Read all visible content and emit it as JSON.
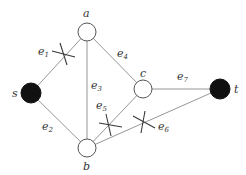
{
  "graph": {
    "nodes": [
      {
        "id": "s",
        "label": "s",
        "x": 31,
        "y": 93,
        "filled": true
      },
      {
        "id": "a",
        "label": "a",
        "x": 87,
        "y": 32,
        "filled": false
      },
      {
        "id": "b",
        "label": "b",
        "x": 87,
        "y": 148,
        "filled": false
      },
      {
        "id": "c",
        "label": "c",
        "x": 143,
        "y": 89,
        "filled": false
      },
      {
        "id": "t",
        "label": "t",
        "x": 220,
        "y": 89,
        "filled": true
      }
    ],
    "edges": [
      {
        "id": "e1",
        "base": "e",
        "sub": "1",
        "from": "s",
        "to": "a",
        "cut": true
      },
      {
        "id": "e2",
        "base": "e",
        "sub": "2",
        "from": "s",
        "to": "b",
        "cut": false
      },
      {
        "id": "e3",
        "base": "e",
        "sub": "3",
        "from": "a",
        "to": "b",
        "cut": false
      },
      {
        "id": "e4",
        "base": "e",
        "sub": "4",
        "from": "a",
        "to": "c",
        "cut": false
      },
      {
        "id": "e5",
        "base": "e",
        "sub": "5",
        "from": "b",
        "to": "c",
        "cut": true
      },
      {
        "id": "e6",
        "base": "e",
        "sub": "6",
        "from": "b",
        "to": "t",
        "cut": true
      },
      {
        "id": "e7",
        "base": "e",
        "sub": "7",
        "from": "c",
        "to": "t",
        "cut": false
      }
    ],
    "labels": {
      "s": "s",
      "a": "a",
      "b": "b",
      "c": "c",
      "t": "t",
      "e": "e",
      "e1_sub": "1",
      "e2_sub": "2",
      "e3_sub": "3",
      "e4_sub": "4",
      "e5_sub": "5",
      "e6_sub": "6",
      "e7_sub": "7"
    }
  }
}
